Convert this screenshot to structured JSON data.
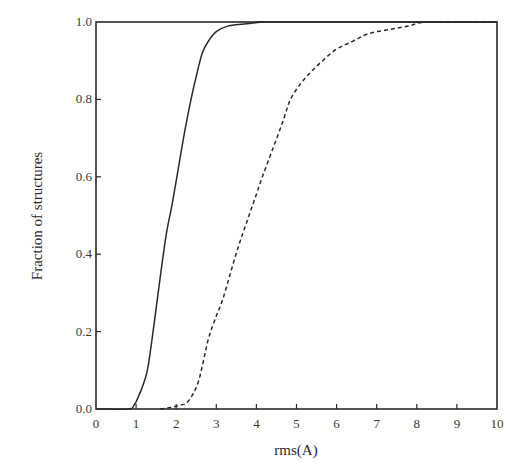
{
  "chart_data": {
    "type": "line",
    "title": "",
    "xlabel": "rms(A)",
    "ylabel": "Fraction of structures",
    "xlim": [
      0,
      10
    ],
    "ylim": [
      0.0,
      1.0
    ],
    "xticks": [
      "0",
      "1",
      "2",
      "3",
      "4",
      "5",
      "6",
      "7",
      "8",
      "9",
      "10"
    ],
    "yticks": [
      "0.0",
      "0.2",
      "0.4",
      "0.6",
      "0.8",
      "1.0"
    ],
    "grid": false,
    "legend": null,
    "series": [
      {
        "name": "solid",
        "style": "solid",
        "x": [
          0.0,
          0.8,
          0.95,
          1.05,
          1.2,
          1.3,
          1.45,
          1.6,
          1.75,
          1.9,
          2.05,
          2.2,
          2.35,
          2.5,
          2.65,
          2.8,
          3.0,
          3.3,
          3.7,
          4.2,
          4.5,
          10.0
        ],
        "y": [
          0.0,
          0.0,
          0.01,
          0.03,
          0.07,
          0.11,
          0.22,
          0.34,
          0.45,
          0.53,
          0.62,
          0.71,
          0.79,
          0.86,
          0.92,
          0.95,
          0.975,
          0.99,
          0.995,
          1.0,
          1.0,
          1.0
        ]
      },
      {
        "name": "dashed",
        "style": "dashed",
        "x": [
          1.6,
          1.9,
          2.1,
          2.3,
          2.55,
          2.8,
          3.0,
          3.15,
          3.35,
          3.55,
          3.75,
          3.95,
          4.15,
          4.4,
          4.65,
          4.85,
          5.1,
          5.35,
          5.65,
          6.0,
          6.4,
          6.8,
          7.3,
          7.8,
          8.3,
          10.0
        ],
        "y": [
          0.0,
          0.005,
          0.01,
          0.02,
          0.07,
          0.18,
          0.24,
          0.28,
          0.35,
          0.42,
          0.48,
          0.54,
          0.6,
          0.67,
          0.74,
          0.8,
          0.84,
          0.87,
          0.9,
          0.93,
          0.95,
          0.97,
          0.98,
          0.99,
          1.0,
          1.0
        ]
      }
    ]
  },
  "colors": {
    "line": "#2a2a2a",
    "axis": "#2a2a2a",
    "background": "#ffffff"
  }
}
